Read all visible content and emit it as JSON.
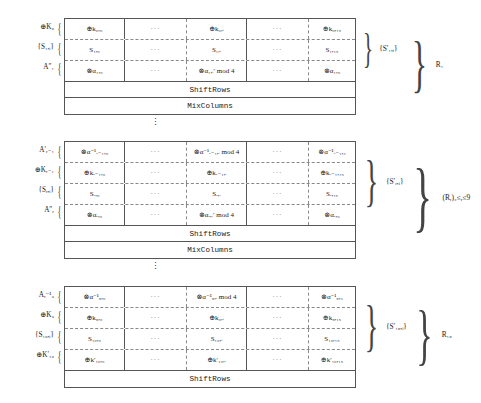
{
  "symbols": {
    "xor": "⊕",
    "otimes": "⊗",
    "alpha": "α",
    "dots_h": "···",
    "dots_v": "⋮",
    "lbrace": "{",
    "rbrace": "}"
  },
  "blocks": [
    {
      "id": "round-1",
      "left_labels": [
        "⊕K₀",
        "{S₁,ᵢ}",
        "A″₁"
      ],
      "rows": [
        {
          "name": "xor-k0-row",
          "cells": [
            "⊕k₀,₀",
            "···",
            "⊕k₀,ᵢ",
            "···",
            "⊕k₀,₁₅"
          ]
        },
        {
          "name": "sbox-s1-row",
          "cells": [
            "S₁,₀",
            "···",
            "S₁,ᵢ",
            "···",
            "S₁,₁₅"
          ]
        },
        {
          "name": "otimes-alpha1-row",
          "cells": [
            "⊗α₁,₀",
            "···",
            "⊗α₁,ᵢ′ mod 4",
            "···",
            "⊗α₁,₀"
          ]
        }
      ],
      "full_rows": [
        "ShiftRows",
        "MixColumns"
      ],
      "inner_brace_label": "{S′₁,ᵢ}",
      "outer_brace_label": "R₁"
    },
    {
      "id": "round-r",
      "left_labels": [
        "A′ᵣ₋₁",
        "⊕Kᵣ₋₁",
        "{Sᵣ,ᵢ}",
        "A″ᵣ"
      ],
      "rows": [
        {
          "name": "otimes-alpha-inv-row",
          "cells": [
            "⊗α⁻¹ᵣ₋₁,₀",
            "···",
            "⊗α⁻¹ᵣ₋₁,ᵢ mod 4",
            "···",
            "⊗α⁻¹ᵣ₋₁,₃"
          ]
        },
        {
          "name": "xor-kr-row",
          "cells": [
            "⊕kᵣ₋₁,₀",
            "···",
            "⊕kᵣ₋₁,ᵢ",
            "···",
            "⊕kᵣ₋₁,₁₅"
          ]
        },
        {
          "name": "sbox-sr-row",
          "cells": [
            "Sᵣ,₀",
            "···",
            "Sᵣ,ᵢ",
            "···",
            "Sᵣ,₁₅"
          ]
        },
        {
          "name": "otimes-alphar-row",
          "cells": [
            "⊗αᵣ,₀",
            "···",
            "⊗αᵣ,ᵢ′ mod 4",
            "···",
            "⊗αᵣ,₀"
          ]
        }
      ],
      "full_rows": [
        "ShiftRows",
        "MixColumns"
      ],
      "inner_brace_label": "{S′ᵣ,ᵢ}",
      "outer_brace_label": "(Rᵣ)₂≤ᵣ≤9"
    },
    {
      "id": "round-10",
      "left_labels": [
        "Aᵣ⁻¹₉",
        "⊕K₉",
        "{S₁₀,ᵢ}",
        "⊕K′₁₀"
      ],
      "rows": [
        {
          "name": "otimes-alpha9-inv-row",
          "cells": [
            "⊗α⁻¹₉,₀",
            "···",
            "⊗α⁻¹₉,ᵢ mod 4",
            "···",
            "⊗α⁻¹₉,₃"
          ]
        },
        {
          "name": "xor-k9-row",
          "cells": [
            "⊕k₉,₀",
            "···",
            "⊕k₀,ᵢ",
            "···",
            "⊕k₉,₁₅"
          ]
        },
        {
          "name": "sbox-s10-row",
          "cells": [
            "S₁₀,₀",
            "···",
            "S₁₀,ᵢ",
            "···",
            "S₁₀,₁₅"
          ]
        },
        {
          "name": "xor-k10-prime-row",
          "cells": [
            "⊕k′₁₀,₀",
            "···",
            "⊕k′₁₀,ᵢ",
            "···",
            "⊕k′₁₀,₁₅"
          ]
        }
      ],
      "full_rows": [
        "ShiftRows"
      ],
      "inner_brace_label": "{S′₁₀,ᵢ}",
      "outer_brace_label": "R₁₀"
    }
  ],
  "ellipses": [
    "⋮",
    "⋮"
  ]
}
